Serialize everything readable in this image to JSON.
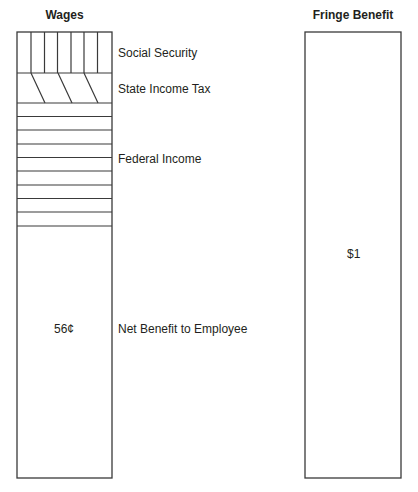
{
  "titles": {
    "wages": "Wages",
    "fringe": "Fringe Benefit"
  },
  "wages_bar": {
    "segments": [
      {
        "name": "Social Security",
        "pattern": "vertical-lines"
      },
      {
        "name": "State Income Tax",
        "pattern": "diagonal-lines"
      },
      {
        "name": "Federal Income",
        "pattern": "horizontal-lines"
      },
      {
        "name": "Net Benefit to Employee",
        "pattern": "none",
        "value": "56¢"
      }
    ]
  },
  "labels": {
    "social_security": "Social Security",
    "state_income_tax": "State Income Tax",
    "federal_income": "Federal Income",
    "net_benefit": "Net Benefit to Employee",
    "net_value": "56¢"
  },
  "fringe_bar": {
    "value": "$1"
  },
  "colors": {
    "line": "#3a3a3a",
    "text": "#231f20",
    "background": "#ffffff"
  }
}
